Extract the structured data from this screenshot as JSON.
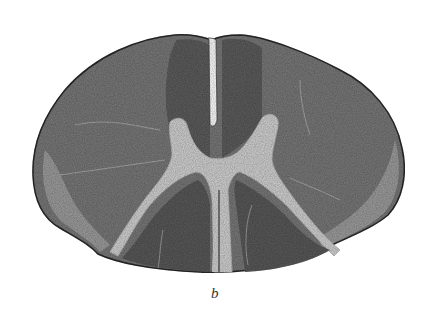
{
  "figure": {
    "label": "b",
    "colors": {
      "background": "#ffffff",
      "white_matter": "#7a7a7a",
      "white_matter_dark": "#5e5e5e",
      "gray_matter": "#d2d2d2",
      "outline": "#2a2a2a"
    }
  }
}
